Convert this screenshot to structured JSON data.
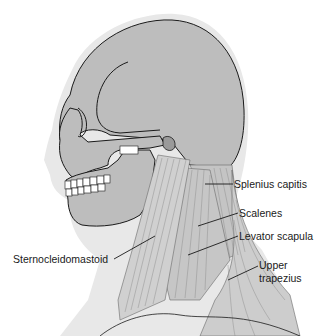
{
  "diagram": {
    "colors": {
      "skull_fill": "#bdbdbd",
      "skin_fill": "#e6e6e6",
      "muscle_fill": "#c8c8c8",
      "muscle_line": "#8a8a8a",
      "outline": "#1a1a1a",
      "background": "#ffffff"
    },
    "labels": [
      {
        "id": "splenius",
        "text": "Splenius capitis"
      },
      {
        "id": "scalenes",
        "text": "Scalenes"
      },
      {
        "id": "levator",
        "text": "Levator scapula"
      },
      {
        "id": "upper_trapezius_1",
        "text": "Upper"
      },
      {
        "id": "upper_trapezius_2",
        "text": "trapezius"
      },
      {
        "id": "sternocleidomastoid",
        "text": "Sternocleidomastoid"
      }
    ]
  }
}
